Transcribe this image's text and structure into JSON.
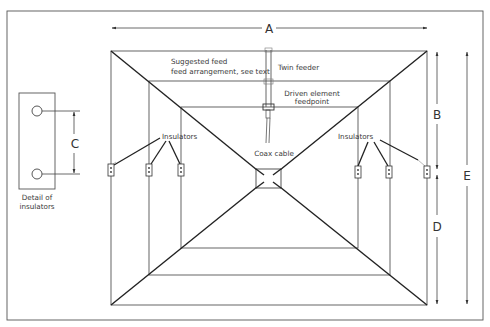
{
  "diagram": {
    "type": "quad-antenna-plan-view",
    "labels": {
      "suggested_feed_line1": "Suggested feed",
      "suggested_feed_line2": "feed arrangement, see text",
      "twin_feeder": "Twin feeder",
      "driven_element_line1": "Driven element",
      "driven_element_line2": "feedpoint",
      "coax_cable": "Coax cable",
      "insulators_left": "Insulators",
      "insulators_right": "Insulators",
      "detail_line1": "Detail of",
      "detail_line2": "insulators"
    },
    "dimensions": {
      "A": "A",
      "B": "B",
      "C": "C",
      "D": "D",
      "E": "E"
    },
    "colors": {
      "background": "#ffffff",
      "line": "#555555",
      "spreader": "#222222",
      "text": "#3a3a3a"
    }
  }
}
